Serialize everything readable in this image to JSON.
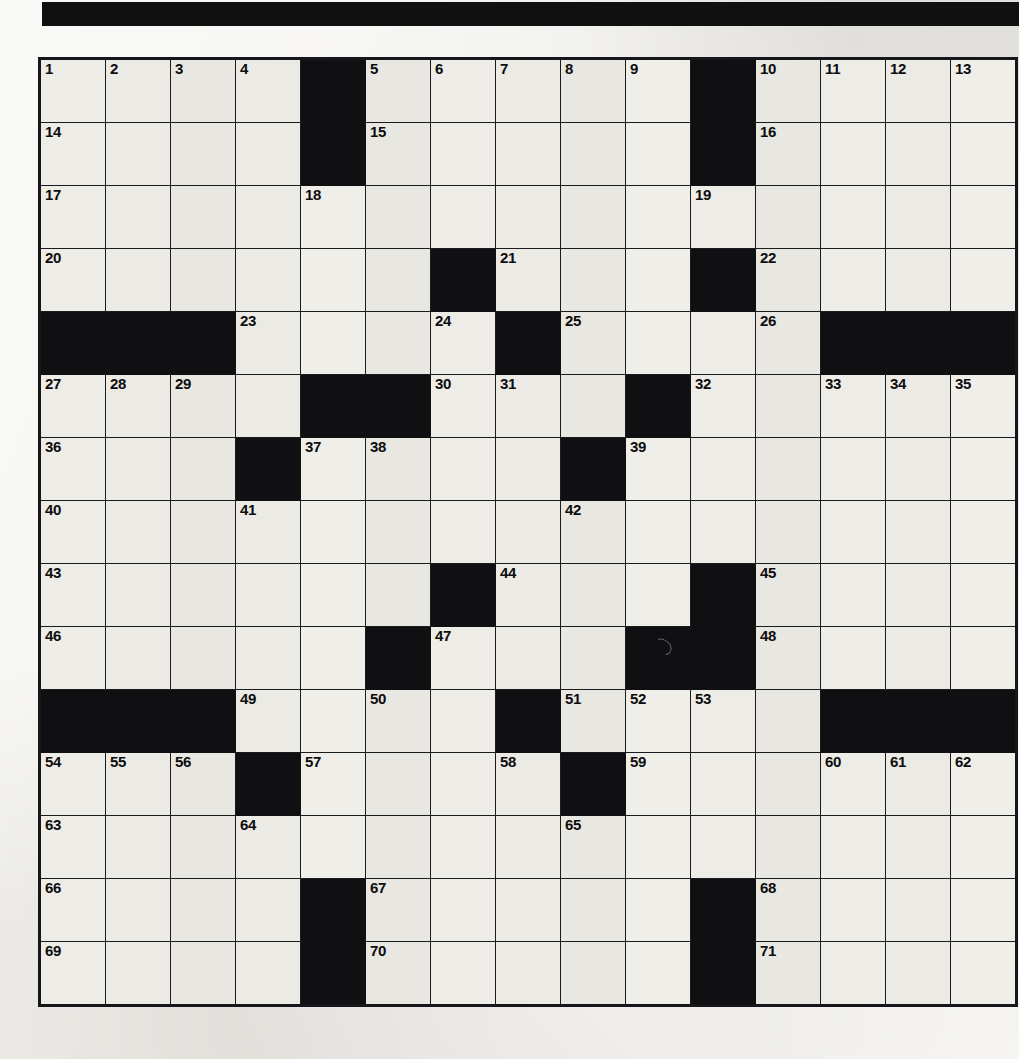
{
  "page": {
    "type": "crossword-puzzle",
    "background_color": "#efeeea",
    "banner_color": "#111010"
  },
  "grid": {
    "rows": 15,
    "columns": 15,
    "open_cell_color": "#eceae4",
    "block_cell_color": "#100f11",
    "border_color": "#1b1a1e",
    "number_color": "#0d0c0e",
    "total_numbered_clues": 71,
    "layout": [
      "....#.....#....",
      "....#.....#....",
      "...............",
      "......#...#....",
      "###....#....###",
      "....##...#.....",
      "...#....#......",
      "...............",
      "......#...#....",
      ".....#...##....",
      "###....#....###",
      "...#....#......",
      "...............",
      "....#.....#....",
      "....#.....#...."
    ],
    "numbers": [
      [
        {
          "col": 0,
          "n": "1"
        },
        {
          "col": 1,
          "n": "2"
        },
        {
          "col": 2,
          "n": "3"
        },
        {
          "col": 3,
          "n": "4"
        },
        {
          "col": 5,
          "n": "5"
        },
        {
          "col": 6,
          "n": "6"
        },
        {
          "col": 7,
          "n": "7"
        },
        {
          "col": 8,
          "n": "8"
        },
        {
          "col": 9,
          "n": "9"
        },
        {
          "col": 11,
          "n": "10"
        },
        {
          "col": 12,
          "n": "11"
        },
        {
          "col": 13,
          "n": "12"
        },
        {
          "col": 14,
          "n": "13"
        }
      ],
      [
        {
          "col": 0,
          "n": "14"
        },
        {
          "col": 5,
          "n": "15"
        },
        {
          "col": 11,
          "n": "16"
        }
      ],
      [
        {
          "col": 0,
          "n": "17"
        },
        {
          "col": 4,
          "n": "18"
        },
        {
          "col": 10,
          "n": "19"
        }
      ],
      [
        {
          "col": 0,
          "n": "20"
        },
        {
          "col": 7,
          "n": "21"
        },
        {
          "col": 11,
          "n": "22"
        }
      ],
      [
        {
          "col": 3,
          "n": "23"
        },
        {
          "col": 6,
          "n": "24"
        },
        {
          "col": 8,
          "n": "25"
        },
        {
          "col": 11,
          "n": "26"
        }
      ],
      [
        {
          "col": 0,
          "n": "27"
        },
        {
          "col": 1,
          "n": "28"
        },
        {
          "col": 2,
          "n": "29"
        },
        {
          "col": 6,
          "n": "30"
        },
        {
          "col": 7,
          "n": "31"
        },
        {
          "col": 10,
          "n": "32"
        },
        {
          "col": 12,
          "n": "33"
        },
        {
          "col": 13,
          "n": "34"
        },
        {
          "col": 14,
          "n": "35"
        }
      ],
      [
        {
          "col": 0,
          "n": "36"
        },
        {
          "col": 4,
          "n": "37"
        },
        {
          "col": 5,
          "n": "38"
        },
        {
          "col": 9,
          "n": "39"
        }
      ],
      [
        {
          "col": 0,
          "n": "40"
        },
        {
          "col": 3,
          "n": "41"
        },
        {
          "col": 8,
          "n": "42"
        }
      ],
      [
        {
          "col": 0,
          "n": "43"
        },
        {
          "col": 7,
          "n": "44"
        },
        {
          "col": 11,
          "n": "45"
        }
      ],
      [
        {
          "col": 0,
          "n": "46"
        },
        {
          "col": 6,
          "n": "47"
        },
        {
          "col": 11,
          "n": "48"
        }
      ],
      [
        {
          "col": 3,
          "n": "49"
        },
        {
          "col": 5,
          "n": "50"
        },
        {
          "col": 8,
          "n": "51"
        },
        {
          "col": 9,
          "n": "52"
        },
        {
          "col": 10,
          "n": "53"
        }
      ],
      [
        {
          "col": 0,
          "n": "54"
        },
        {
          "col": 1,
          "n": "55"
        },
        {
          "col": 2,
          "n": "56"
        },
        {
          "col": 4,
          "n": "57"
        },
        {
          "col": 7,
          "n": "58"
        },
        {
          "col": 9,
          "n": "59"
        },
        {
          "col": 12,
          "n": "60"
        },
        {
          "col": 13,
          "n": "61"
        },
        {
          "col": 14,
          "n": "62"
        }
      ],
      [
        {
          "col": 0,
          "n": "63"
        },
        {
          "col": 3,
          "n": "64"
        },
        {
          "col": 8,
          "n": "65"
        }
      ],
      [
        {
          "col": 0,
          "n": "66"
        },
        {
          "col": 5,
          "n": "67"
        },
        {
          "col": 11,
          "n": "68"
        }
      ],
      [
        {
          "col": 0,
          "n": "69"
        },
        {
          "col": 5,
          "n": "70"
        },
        {
          "col": 11,
          "n": "71"
        }
      ]
    ]
  }
}
